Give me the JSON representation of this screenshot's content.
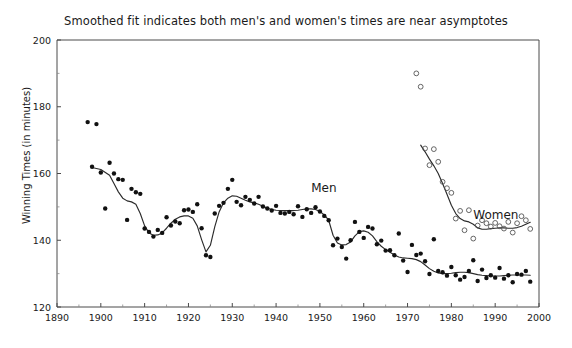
{
  "chart_data": {
    "type": "scatter",
    "title": "Smoothed fit indicates both men's and women's times are near asymptotes",
    "xlabel": "",
    "ylabel": "Winning Times (in minutes)",
    "xlim": [
      1890,
      2000
    ],
    "ylim": [
      120,
      200
    ],
    "grid": false,
    "legend_position": "inline-annotation",
    "x_ticks": [
      1890,
      1900,
      1910,
      1920,
      1930,
      1940,
      1950,
      1960,
      1970,
      1980,
      1990,
      2000
    ],
    "x_minor_ticks": [
      1895,
      1905,
      1915,
      1925,
      1935,
      1945,
      1955,
      1965,
      1975,
      1985,
      1995
    ],
    "y_ticks": [
      120,
      140,
      160,
      180,
      200
    ],
    "y_minor_ticks": [
      130,
      150,
      170,
      190
    ],
    "annotations": [
      {
        "text": "Men",
        "x": 1948,
        "y": 154.5
      },
      {
        "text": "Women",
        "x": 1985,
        "y": 146.5
      }
    ],
    "series": [
      {
        "name": "Men",
        "marker": "filled-circle",
        "color": "#111111",
        "points": [
          [
            1897,
            175.4
          ],
          [
            1898,
            162.0
          ],
          [
            1899,
            174.8
          ],
          [
            1900,
            160.3
          ],
          [
            1901,
            149.5
          ],
          [
            1902,
            163.2
          ],
          [
            1903,
            160.0
          ],
          [
            1904,
            158.3
          ],
          [
            1905,
            158.1
          ],
          [
            1906,
            146.1
          ],
          [
            1907,
            155.4
          ],
          [
            1908,
            154.4
          ],
          [
            1909,
            153.9
          ],
          [
            1910,
            143.5
          ],
          [
            1911,
            142.5
          ],
          [
            1912,
            141.1
          ],
          [
            1913,
            143.1
          ],
          [
            1914,
            142.2
          ],
          [
            1915,
            146.9
          ],
          [
            1916,
            144.4
          ],
          [
            1917,
            145.6
          ],
          [
            1918,
            145.1
          ],
          [
            1919,
            149.0
          ],
          [
            1920,
            149.2
          ],
          [
            1921,
            148.5
          ],
          [
            1922,
            150.8
          ],
          [
            1923,
            143.6
          ],
          [
            1924,
            135.5
          ],
          [
            1925,
            135.0
          ],
          [
            1926,
            148.0
          ],
          [
            1927,
            150.3
          ],
          [
            1928,
            151.2
          ],
          [
            1929,
            155.4
          ],
          [
            1930,
            158.1
          ],
          [
            1931,
            151.5
          ],
          [
            1932,
            150.5
          ],
          [
            1933,
            153.0
          ],
          [
            1934,
            152.1
          ],
          [
            1935,
            151.0
          ],
          [
            1936,
            153.0
          ],
          [
            1937,
            150.1
          ],
          [
            1938,
            149.5
          ],
          [
            1939,
            148.9
          ],
          [
            1940,
            150.3
          ],
          [
            1941,
            148.2
          ],
          [
            1942,
            148.0
          ],
          [
            1943,
            148.5
          ],
          [
            1944,
            147.8
          ],
          [
            1945,
            150.2
          ],
          [
            1946,
            147.0
          ],
          [
            1947,
            149.3
          ],
          [
            1948,
            148.2
          ],
          [
            1949,
            149.9
          ],
          [
            1950,
            148.6
          ],
          [
            1951,
            147.3
          ],
          [
            1952,
            146.0
          ],
          [
            1953,
            138.5
          ],
          [
            1954,
            140.5
          ],
          [
            1955,
            138.0
          ],
          [
            1956,
            134.5
          ],
          [
            1957,
            140.0
          ],
          [
            1958,
            145.5
          ],
          [
            1959,
            142.5
          ],
          [
            1960,
            140.7
          ],
          [
            1961,
            144.0
          ],
          [
            1962,
            143.5
          ],
          [
            1963,
            138.8
          ],
          [
            1964,
            139.9
          ],
          [
            1965,
            136.9
          ],
          [
            1966,
            137.0
          ],
          [
            1967,
            135.5
          ],
          [
            1968,
            142.0
          ],
          [
            1969,
            133.9
          ],
          [
            1970,
            130.5
          ],
          [
            1971,
            138.6
          ],
          [
            1972,
            135.6
          ],
          [
            1973,
            136.0
          ],
          [
            1974,
            133.7
          ],
          [
            1975,
            129.9
          ],
          [
            1976,
            140.3
          ],
          [
            1977,
            130.8
          ],
          [
            1978,
            130.4
          ],
          [
            1979,
            129.4
          ],
          [
            1980,
            132.0
          ],
          [
            1981,
            129.5
          ],
          [
            1982,
            128.2
          ],
          [
            1983,
            129.0
          ],
          [
            1984,
            130.8
          ],
          [
            1985,
            134.0
          ],
          [
            1986,
            127.8
          ],
          [
            1987,
            131.2
          ],
          [
            1988,
            128.7
          ],
          [
            1989,
            129.5
          ],
          [
            1990,
            128.8
          ],
          [
            1991,
            131.7
          ],
          [
            1992,
            128.5
          ],
          [
            1993,
            129.5
          ],
          [
            1994,
            127.4
          ],
          [
            1995,
            129.9
          ],
          [
            1996,
            129.7
          ],
          [
            1997,
            130.8
          ],
          [
            1998,
            127.6
          ]
        ]
      },
      {
        "name": "Women",
        "marker": "open-circle",
        "color": "#555555",
        "points": [
          [
            1972,
            190.0
          ],
          [
            1973,
            186.0
          ],
          [
            1974,
            167.5
          ],
          [
            1975,
            162.5
          ],
          [
            1976,
            167.3
          ],
          [
            1977,
            163.5
          ],
          [
            1978,
            157.5
          ],
          [
            1979,
            155.6
          ],
          [
            1980,
            154.2
          ],
          [
            1981,
            146.5
          ],
          [
            1982,
            148.8
          ],
          [
            1983,
            143.0
          ],
          [
            1984,
            149.0
          ],
          [
            1985,
            140.5
          ],
          [
            1986,
            144.4
          ],
          [
            1987,
            146.0
          ],
          [
            1988,
            145.1
          ],
          [
            1989,
            144.1
          ],
          [
            1990,
            145.2
          ],
          [
            1991,
            144.2
          ],
          [
            1992,
            143.5
          ],
          [
            1993,
            145.5
          ],
          [
            1994,
            142.3
          ],
          [
            1995,
            145.1
          ],
          [
            1996,
            147.2
          ],
          [
            1997,
            146.0
          ],
          [
            1998,
            143.4
          ]
        ]
      }
    ],
    "fits": [
      {
        "name": "Men smoothed fit",
        "points": [
          [
            1898,
            161.8
          ],
          [
            1900,
            161.2
          ],
          [
            1902,
            159.5
          ],
          [
            1903,
            157.0
          ],
          [
            1904,
            154.5
          ],
          [
            1905,
            152.6
          ],
          [
            1906,
            151.8
          ],
          [
            1907,
            151.5
          ],
          [
            1908,
            150.8
          ],
          [
            1909,
            148.0
          ],
          [
            1910,
            144.3
          ],
          [
            1911,
            142.2
          ],
          [
            1912,
            141.5
          ],
          [
            1913,
            141.6
          ],
          [
            1914,
            142.2
          ],
          [
            1915,
            143.6
          ],
          [
            1916,
            145.1
          ],
          [
            1917,
            146.3
          ],
          [
            1918,
            147.0
          ],
          [
            1919,
            147.3
          ],
          [
            1920,
            147.3
          ],
          [
            1921,
            146.6
          ],
          [
            1922,
            144.3
          ],
          [
            1923,
            140.2
          ],
          [
            1924,
            136.5
          ],
          [
            1925,
            138.5
          ],
          [
            1926,
            144.0
          ],
          [
            1927,
            148.5
          ],
          [
            1928,
            151.2
          ],
          [
            1929,
            152.6
          ],
          [
            1930,
            153.3
          ],
          [
            1931,
            153.2
          ],
          [
            1932,
            152.6
          ],
          [
            1933,
            152.0
          ],
          [
            1934,
            151.5
          ],
          [
            1935,
            151.2
          ],
          [
            1936,
            150.8
          ],
          [
            1937,
            150.2
          ],
          [
            1938,
            149.6
          ],
          [
            1939,
            149.2
          ],
          [
            1940,
            149.0
          ],
          [
            1941,
            148.9
          ],
          [
            1942,
            148.9
          ],
          [
            1943,
            148.9
          ],
          [
            1944,
            148.9
          ],
          [
            1945,
            149.0
          ],
          [
            1946,
            149.2
          ],
          [
            1947,
            149.4
          ],
          [
            1948,
            149.4
          ],
          [
            1949,
            149.2
          ],
          [
            1950,
            148.6
          ],
          [
            1951,
            147.6
          ],
          [
            1952,
            146.0
          ],
          [
            1953,
            141.5
          ],
          [
            1954,
            139.2
          ],
          [
            1955,
            138.6
          ],
          [
            1956,
            138.7
          ],
          [
            1957,
            139.5
          ],
          [
            1958,
            141.3
          ],
          [
            1959,
            142.6
          ],
          [
            1960,
            142.8
          ],
          [
            1961,
            142.4
          ],
          [
            1962,
            141.3
          ],
          [
            1963,
            139.6
          ],
          [
            1964,
            138.2
          ],
          [
            1965,
            137.2
          ],
          [
            1966,
            136.4
          ],
          [
            1967,
            135.6
          ],
          [
            1968,
            135.0
          ],
          [
            1969,
            134.7
          ],
          [
            1970,
            134.6
          ],
          [
            1971,
            134.5
          ],
          [
            1972,
            134.2
          ],
          [
            1973,
            133.6
          ],
          [
            1974,
            132.6
          ],
          [
            1975,
            131.5
          ],
          [
            1976,
            130.7
          ],
          [
            1977,
            130.2
          ],
          [
            1978,
            130.0
          ],
          [
            1979,
            130.0
          ],
          [
            1980,
            130.1
          ],
          [
            1981,
            130.3
          ],
          [
            1982,
            130.4
          ],
          [
            1983,
            130.4
          ],
          [
            1984,
            130.3
          ],
          [
            1985,
            130.0
          ],
          [
            1986,
            129.7
          ],
          [
            1987,
            129.5
          ],
          [
            1988,
            129.4
          ],
          [
            1989,
            129.3
          ],
          [
            1990,
            129.3
          ],
          [
            1991,
            129.3
          ],
          [
            1992,
            129.4
          ],
          [
            1993,
            129.5
          ],
          [
            1994,
            129.6
          ],
          [
            1995,
            129.6
          ],
          [
            1996,
            129.6
          ],
          [
            1997,
            129.6
          ],
          [
            1998,
            129.5
          ]
        ]
      },
      {
        "name": "Women smoothed fit",
        "points": [
          [
            1973,
            168.5
          ],
          [
            1974,
            166.5
          ],
          [
            1975,
            164.3
          ],
          [
            1976,
            162.3
          ],
          [
            1977,
            160.0
          ],
          [
            1978,
            157.0
          ],
          [
            1979,
            153.8
          ],
          [
            1980,
            150.5
          ],
          [
            1981,
            148.0
          ],
          [
            1982,
            146.5
          ],
          [
            1983,
            145.8
          ],
          [
            1984,
            145.5
          ],
          [
            1985,
            144.8
          ],
          [
            1986,
            143.7
          ],
          [
            1987,
            143.3
          ],
          [
            1988,
            143.3
          ],
          [
            1989,
            143.5
          ],
          [
            1990,
            143.6
          ],
          [
            1991,
            143.7
          ],
          [
            1992,
            143.7
          ],
          [
            1993,
            143.6
          ],
          [
            1994,
            143.6
          ],
          [
            1995,
            143.8
          ],
          [
            1996,
            144.2
          ],
          [
            1997,
            144.8
          ],
          [
            1998,
            145.4
          ]
        ]
      }
    ]
  }
}
